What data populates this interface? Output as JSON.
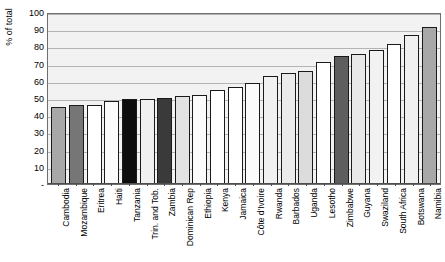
{
  "chart_data": {
    "type": "bar",
    "title": "",
    "subtitle": "",
    "xlabel": "",
    "ylabel": "% of total",
    "ylim": [
      0,
      100
    ],
    "ytick_labels": [
      "-",
      "10",
      "20",
      "30",
      "40",
      "50",
      "60",
      "70",
      "80",
      "90",
      "100"
    ],
    "ytick_values": [
      0,
      10,
      20,
      30,
      40,
      50,
      60,
      70,
      80,
      90,
      100
    ],
    "grid": true,
    "legend": "none",
    "categories": [
      "Cambodia",
      "Mozambique",
      "Eritrea",
      "Haiti",
      "Tanzania",
      "Trin. and Tob.",
      "Zambia",
      "Dominican Rep",
      "Ethiopia",
      "Kenya",
      "Jamaica",
      "Côte d'Ivoire",
      "Rwanda",
      "Barbados",
      "Uganda",
      "Lesotho",
      "Zimbabwe",
      "Guyana",
      "Swaziland",
      "South Africa",
      "Botswana",
      "Namibia"
    ],
    "values": [
      45,
      45.7,
      45.8,
      48,
      49.2,
      49.6,
      50.3,
      51,
      51.7,
      54.4,
      56.2,
      58.8,
      62.6,
      64.7,
      65.9,
      70.7,
      74.3,
      75.7,
      78,
      81.7,
      86.4,
      91.2
    ],
    "bar_colors": [
      "#a8a8a8",
      "#767676",
      "#ffffff",
      "#fbfbfb",
      "#0d0d0d",
      "#f0f0f0",
      "#3a3a3a",
      "#e3e3e3",
      "#fbfbfb",
      "#ffffff",
      "#ffffff",
      "#fbfbfb",
      "#f0f0f0",
      "#ebebeb",
      "#dcdcdc",
      "#ffffff",
      "#5e5e5e",
      "#e8e8e8",
      "#f2f2f2",
      "#ffffff",
      "#f0f0f0",
      "#a8a8a8"
    ],
    "plot_background": "#f2f2f2",
    "gridline_color": "#b4b4b4",
    "axis_color": "#4d4d4d",
    "bar_border_color": "#1a1a1a"
  }
}
